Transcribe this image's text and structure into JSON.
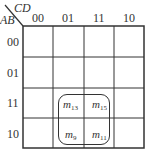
{
  "kmap": {
    "row_var": "AB",
    "col_var": "CD",
    "col_labels": [
      "00",
      "01",
      "11",
      "10"
    ],
    "row_labels": [
      "00",
      "01",
      "11",
      "10"
    ],
    "cells": {
      "r2c1": {
        "m": "m",
        "sub": "13"
      },
      "r2c2": {
        "m": "m",
        "sub": "15"
      },
      "r3c1": {
        "m": "m",
        "sub": "9"
      },
      "r3c2": {
        "m": "m",
        "sub": "11"
      }
    },
    "group": [
      "m13",
      "m15",
      "m9",
      "m11"
    ],
    "line_color": "#333333"
  }
}
